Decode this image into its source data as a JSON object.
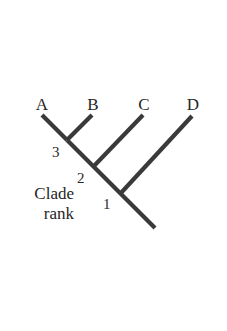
{
  "figure": {
    "type": "cladogram",
    "background_color": "#ffffff",
    "branch_color": "#3a3a3a",
    "text_color": "#262626"
  },
  "caption": {
    "line1": "Clade",
    "line2": "rank"
  },
  "tips": [
    {
      "label": "A",
      "x": 42,
      "y": 115,
      "label_x": 30,
      "label_y": 96
    },
    {
      "label": "B",
      "x": 92,
      "y": 115,
      "label_x": 81,
      "label_y": 96
    },
    {
      "label": "C",
      "x": 143,
      "y": 115,
      "label_x": 132,
      "label_y": 96
    },
    {
      "label": "D",
      "x": 192,
      "y": 116,
      "label_x": 181,
      "label_y": 96
    }
  ],
  "nodes": [
    {
      "label": "1",
      "x": 120,
      "y": 194,
      "label_x": 103,
      "label_y": 197
    },
    {
      "label": "2",
      "x": 93,
      "y": 167,
      "label_x": 77,
      "label_y": 171
    },
    {
      "label": "3",
      "x": 67,
      "y": 140,
      "label_x": 52,
      "label_y": 145
    }
  ],
  "branches": [
    {
      "name": "branch-A",
      "x1": 42,
      "y1": 115,
      "x2": 67,
      "y2": 140
    },
    {
      "name": "branch-B",
      "x1": 92,
      "y1": 115,
      "x2": 67,
      "y2": 140
    },
    {
      "name": "branch-C",
      "x1": 143,
      "y1": 115,
      "x2": 93,
      "y2": 167
    },
    {
      "name": "branch-D",
      "x1": 192,
      "y1": 116,
      "x2": 120,
      "y2": 194
    },
    {
      "name": "trunk",
      "x1": 67,
      "y1": 140,
      "x2": 155,
      "y2": 228
    }
  ],
  "chart_data": {
    "type": "diagram",
    "title": "",
    "newick": "(((A,B)3,C)2,D)1;",
    "taxa": [
      "A",
      "B",
      "C",
      "D"
    ],
    "clade_ranks": [
      {
        "rank": "1",
        "members": [
          "A",
          "B",
          "C",
          "D"
        ]
      },
      {
        "rank": "2",
        "members": [
          "A",
          "B",
          "C"
        ]
      },
      {
        "rank": "3",
        "members": [
          "A",
          "B"
        ]
      }
    ],
    "axis_label": "Clade rank"
  }
}
